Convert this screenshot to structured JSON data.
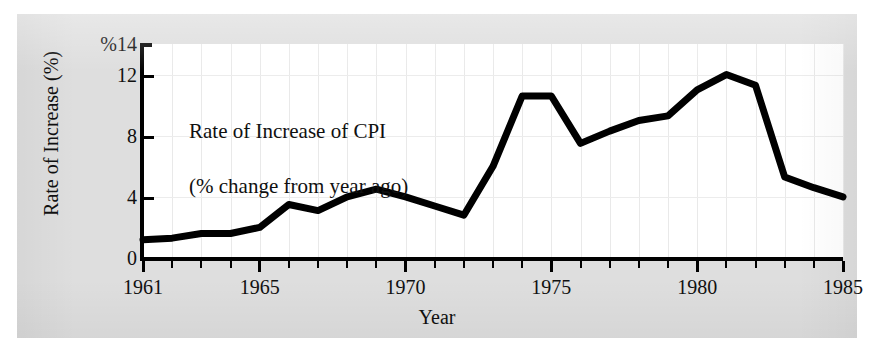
{
  "chart_data": {
    "type": "line",
    "title": "",
    "annotation": {
      "line1": "Rate of Increase of CPI",
      "line2": "(% change from year ago)"
    },
    "xlabel": "Year",
    "ylabel": "Rate of Increase (%)",
    "y_unit_prefix": "%",
    "xlim": [
      1961,
      1985
    ],
    "ylim": [
      0,
      14
    ],
    "y_ticks": [
      0,
      4,
      8,
      12,
      14
    ],
    "y_tick_labels": [
      "0",
      "4",
      "8",
      "12",
      "%14"
    ],
    "x_ticks": [
      1961,
      1965,
      1970,
      1975,
      1980,
      1985
    ],
    "x_tick_labels": [
      "1961",
      "1965",
      "1970",
      "1975",
      "1980",
      "1985"
    ],
    "x_minor_tick_step": 1,
    "grid": true,
    "grid_color": "#e9e9e9",
    "legend": "none",
    "line_color": "#000000",
    "line_width_px": 7,
    "background_color": "#dedede",
    "plot_background_color": "#ffffff",
    "x": [
      1961,
      1962,
      1963,
      1964,
      1965,
      1966,
      1967,
      1968,
      1969,
      1970,
      1971,
      1972,
      1973,
      1974,
      1975,
      1976,
      1977,
      1978,
      1979,
      1980,
      1981,
      1982,
      1983,
      1984,
      1985
    ],
    "values": [
      1.2,
      1.3,
      1.6,
      1.6,
      2.0,
      3.5,
      3.1,
      4.0,
      4.5,
      4.0,
      3.4,
      2.8,
      6.0,
      10.6,
      10.6,
      7.5,
      8.3,
      9.0,
      9.3,
      11.0,
      12.0,
      11.3,
      5.3,
      4.6,
      4.0
    ],
    "series": [
      {
        "name": "Rate of Increase of CPI (% change from year ago)",
        "values": [
          1.2,
          1.3,
          1.6,
          1.6,
          2.0,
          3.5,
          3.1,
          4.0,
          4.5,
          4.0,
          3.4,
          2.8,
          6.0,
          10.6,
          10.6,
          7.5,
          8.3,
          9.0,
          9.3,
          11.0,
          12.0,
          11.3,
          5.3,
          4.6,
          4.0
        ]
      }
    ]
  }
}
